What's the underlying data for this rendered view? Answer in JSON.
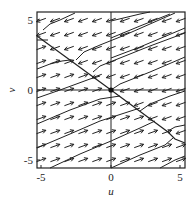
{
  "chart_data": {
    "type": "vector_field_phase_portrait",
    "title": "",
    "xlabel": "u",
    "ylabel": "v",
    "xlim": [
      -5.3,
      5.3
    ],
    "ylim": [
      -5.6,
      5.6
    ],
    "xticks": [
      -5,
      0,
      5
    ],
    "yticks": [
      -5,
      0,
      5
    ],
    "xtick_labels": [
      "-5",
      "0",
      "5"
    ],
    "ytick_labels": [
      "-5",
      "0",
      "5"
    ],
    "grid": false,
    "axes_lines_through_origin": true,
    "equilibrium_point": [
      0,
      0
    ],
    "separatrix": {
      "description": "line through origin, slope approx -0.73",
      "points": [
        [
          -5.3,
          3.9
        ],
        [
          0,
          0
        ],
        [
          5.3,
          -3.8
        ]
      ]
    },
    "trajectory_slope": 0.4,
    "field_description": "Above the separatrix arrows point left and slightly down; below the separatrix arrows point right and slightly up. Trajectories are near-parallel lines of slope ~0.4 that bend along the separatrix.",
    "arrow_grid": {
      "u": [
        -5,
        -4,
        -3,
        -2,
        -1,
        0,
        1,
        2,
        3,
        4,
        5
      ],
      "v": [
        -5,
        -4,
        -3,
        -2,
        -1,
        0,
        1,
        2,
        3,
        4,
        5
      ]
    },
    "arrow_direction_above": "left-down (~200 deg)",
    "arrow_direction_below": "right-up (~20 deg)"
  },
  "labels": {
    "x_axis": "u",
    "y_axis": "v",
    "x_ticks": [
      "-5",
      "0",
      "5"
    ],
    "y_ticks": [
      "5",
      "0",
      "-5"
    ]
  },
  "colors": {
    "ink": "#222222",
    "background": "#ffffff"
  }
}
